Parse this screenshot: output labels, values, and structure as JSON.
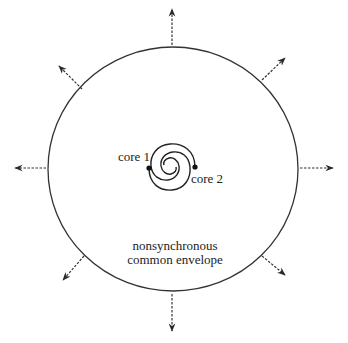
{
  "diagram": {
    "envelope": {
      "label_line1": "nonsynchronous",
      "label_line2": "common envelope",
      "center": [
        173,
        169
      ],
      "radius": 123,
      "stroke": "#333333"
    },
    "cores": [
      {
        "label": "core 1",
        "position": [
          149,
          168
        ]
      },
      {
        "label": "core 2",
        "position": [
          195,
          167
        ]
      }
    ],
    "outflow_arrows": [
      {
        "direction": "up",
        "from": [
          172,
          45
        ],
        "to": [
          172,
          8
        ]
      },
      {
        "direction": "upper-right",
        "from": [
          262,
          80
        ],
        "to": [
          286,
          57
        ]
      },
      {
        "direction": "right",
        "from": [
          298,
          168
        ],
        "to": [
          334,
          168
        ]
      },
      {
        "direction": "lower-right",
        "from": [
          262,
          256
        ],
        "to": [
          286,
          276
        ]
      },
      {
        "direction": "down",
        "from": [
          172,
          293
        ],
        "to": [
          172,
          332
        ]
      },
      {
        "direction": "lower-left",
        "from": [
          83,
          257
        ],
        "to": [
          62,
          281
        ]
      },
      {
        "direction": "left",
        "from": [
          48,
          168
        ],
        "to": [
          14,
          168
        ]
      },
      {
        "direction": "upper-left",
        "from": [
          82,
          89
        ],
        "to": [
          58,
          65
        ]
      }
    ],
    "colors": {
      "line": "#333333",
      "background": "#ffffff"
    }
  }
}
